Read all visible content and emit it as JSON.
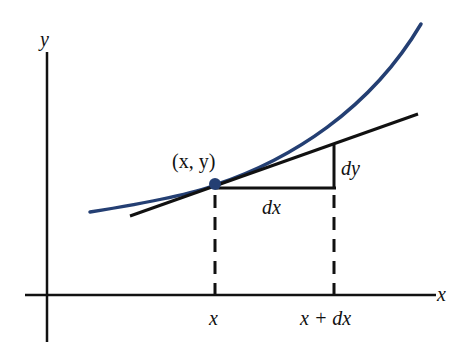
{
  "diagram": {
    "colors": {
      "curve": "#243f73",
      "axes": "#111111",
      "point": "#243f73"
    },
    "axes": {
      "x_label": "x",
      "y_label": "y"
    },
    "point_label": "(x, y)",
    "labels": {
      "dx": "dx",
      "dy": "dy",
      "x_tick": "x",
      "x_plus_dx_tick": "x + dx"
    }
  }
}
